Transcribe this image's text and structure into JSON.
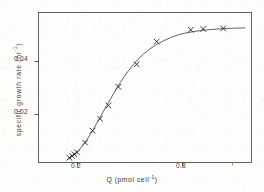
{
  "chart_data": {
    "type": "scatter",
    "title": "",
    "subtitle": "",
    "xlabel_text": "Q (pmol cell",
    "xlabel_sup": "-1",
    "xlabel_tail": ")",
    "ylabel_text": "specific growth rate  (hr",
    "ylabel_sup": "-1",
    "ylabel_tail": ")",
    "xlabel": "Q (pmol cell^-1)",
    "ylabel": "specific growth rate (hr^-1)",
    "xlim": [
      0.02,
      1.3
    ],
    "ylim": [
      0.0,
      0.0565
    ],
    "grid": false,
    "legend": null,
    "xticks": [
      0.2,
      0.8,
      1.1
    ],
    "xticklabels": [
      "0.2",
      "0.8",
      ""
    ],
    "yticks": [
      0.02,
      0.04
    ],
    "yticklabels": [
      "0.02",
      "0.04"
    ],
    "marker": "x",
    "series": [
      {
        "name": "observed growth rate",
        "marker": "x",
        "x": [
          0.205,
          0.222,
          0.236,
          0.252,
          0.3,
          0.345,
          0.39,
          0.44,
          0.5,
          0.61,
          0.73,
          0.935,
          1.01,
          1.13
        ],
        "values": [
          0.0018,
          0.0025,
          0.0031,
          0.0038,
          0.0075,
          0.012,
          0.0165,
          0.0215,
          0.0285,
          0.037,
          0.0455,
          0.05,
          0.0503,
          0.0505
        ]
      }
    ],
    "fit_curve": {
      "name": "fitted sigmoid (Droop/Monod) curve",
      "x": [
        0.195,
        0.23,
        0.27,
        0.31,
        0.35,
        0.39,
        0.43,
        0.47,
        0.51,
        0.56,
        0.62,
        0.69,
        0.77,
        0.86,
        0.96,
        1.06,
        1.16,
        1.26
      ],
      "values": [
        0.0012,
        0.0028,
        0.0052,
        0.0085,
        0.0125,
        0.017,
        0.0215,
        0.0258,
        0.03,
        0.0345,
        0.039,
        0.0428,
        0.0458,
        0.0481,
        0.0494,
        0.0501,
        0.0505,
        0.0507
      ]
    },
    "colors": {
      "axis": "#46463f",
      "marker": "#2e2e2c",
      "curve": "#5a5a54",
      "text": "#3a3a38",
      "background": "#fdfdfc"
    }
  }
}
